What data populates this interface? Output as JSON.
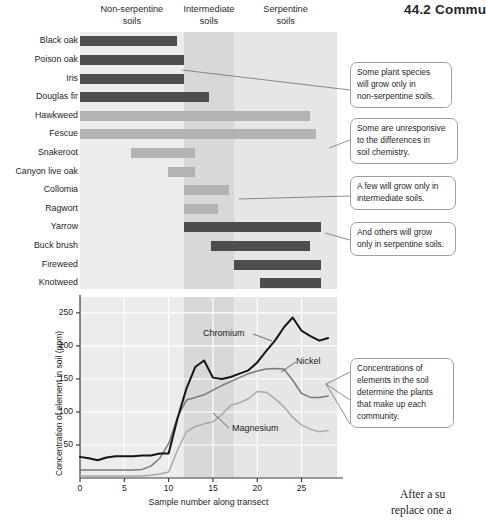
{
  "page": {
    "header": "44.2  Commu",
    "footer_line1": "After a su",
    "footer_line2": "replace one a"
  },
  "zones": [
    {
      "name": "non-serpentine",
      "line1": "Non-serpentine",
      "line2": "soils",
      "color": "#ececec"
    },
    {
      "name": "intermediate",
      "line1": "Intermediate",
      "line2": "soils",
      "color": "#d8d8d8"
    },
    {
      "name": "serpentine",
      "line1": "Serpentine",
      "line2": "soils",
      "color": "#e6e6e6"
    }
  ],
  "colors": {
    "bar_dark": "#4d4d4d",
    "bar_light": "#b3b3b3",
    "chromium": "#141414",
    "nickel": "#7a7a7a",
    "magnesium": "#a8a8a8",
    "callout_border": "#9aa0a6",
    "axis": "#3c3c3c"
  },
  "bar_chart": {
    "type": "bar",
    "orientation": "horizontal",
    "xlabel": "",
    "ylabel": "",
    "axis_min": 0,
    "axis_max": 29,
    "species": [
      {
        "label": "Black oak",
        "start": 0,
        "end": 11.0,
        "shade": "dark"
      },
      {
        "label": "Poison oak",
        "start": 0,
        "end": 11.7,
        "shade": "dark"
      },
      {
        "label": "Iris",
        "start": 0,
        "end": 11.7,
        "shade": "dark"
      },
      {
        "label": "Douglas fir",
        "start": 0,
        "end": 14.5,
        "shade": "dark"
      },
      {
        "label": "Hawkweed",
        "start": 0,
        "end": 26.0,
        "shade": "light"
      },
      {
        "label": "Fescue",
        "start": 0,
        "end": 26.6,
        "shade": "light"
      },
      {
        "label": "Snakeroot",
        "start": 5.8,
        "end": 13.0,
        "shade": "light"
      },
      {
        "label": "Canyon live oak",
        "start": 9.9,
        "end": 13.0,
        "shade": "light"
      },
      {
        "label": "Collomia",
        "start": 11.7,
        "end": 16.8,
        "shade": "light"
      },
      {
        "label": "Ragwort",
        "start": 11.7,
        "end": 15.6,
        "shade": "light"
      },
      {
        "label": "Yarrow",
        "start": 11.7,
        "end": 27.2,
        "shade": "dark"
      },
      {
        "label": "Buck brush",
        "start": 14.8,
        "end": 26.0,
        "shade": "dark"
      },
      {
        "label": "Fireweed",
        "start": 17.4,
        "end": 27.2,
        "shade": "dark"
      },
      {
        "label": "Knotweed",
        "start": 20.3,
        "end": 27.2,
        "shade": "dark"
      }
    ]
  },
  "chart_data": {
    "type": "line",
    "title": "",
    "xlabel": "Sample number along transect",
    "ylabel": "Concentration of element in soil (ppm)",
    "xlim": [
      0,
      29
    ],
    "ylim": [
      0,
      265
    ],
    "xticks": [
      0,
      5,
      10,
      15,
      20,
      25
    ],
    "yticks": [
      50,
      100,
      150,
      200,
      250
    ],
    "grid": true,
    "legend_position": "inline-annotations",
    "x": [
      0,
      1,
      2,
      3,
      4,
      5,
      6,
      7,
      8,
      9,
      10,
      11,
      12,
      13,
      14,
      15,
      16,
      17,
      18,
      19,
      20,
      21,
      22,
      23,
      24,
      25,
      26,
      27,
      28
    ],
    "series": [
      {
        "name": "Chromium",
        "color": "#141414",
        "values": [
          32,
          30,
          27,
          31,
          33,
          33,
          33,
          34,
          34,
          37,
          37,
          90,
          135,
          168,
          178,
          152,
          150,
          153,
          158,
          163,
          175,
          192,
          208,
          228,
          243,
          223,
          215,
          208,
          212
        ]
      },
      {
        "name": "Nickel",
        "color": "#7a7a7a",
        "values": [
          12,
          12,
          12,
          12,
          12,
          12,
          12,
          13,
          18,
          30,
          52,
          92,
          118,
          122,
          126,
          133,
          140,
          146,
          152,
          158,
          162,
          165,
          166,
          165,
          148,
          128,
          122,
          122,
          124
        ]
      },
      {
        "name": "Magnesium",
        "color": "#a8a8a8",
        "values": [
          3,
          3,
          3,
          3,
          3,
          3,
          3,
          3,
          4,
          6,
          9,
          42,
          70,
          78,
          82,
          85,
          96,
          110,
          114,
          120,
          131,
          130,
          120,
          108,
          92,
          80,
          74,
          70,
          72
        ]
      }
    ],
    "annotations": [
      {
        "text": "Chromium",
        "series": "Chromium"
      },
      {
        "text": "Nickel",
        "series": "Nickel"
      },
      {
        "text": "Magnesium",
        "series": "Magnesium"
      }
    ]
  },
  "callouts": [
    {
      "id": "c1",
      "lines": [
        "Some plant species",
        "will grow only in",
        "non-serpentine soils."
      ]
    },
    {
      "id": "c2",
      "lines": [
        "Some are unresponsive",
        "to the differences in",
        "soil chemistry."
      ]
    },
    {
      "id": "c3",
      "lines": [
        "A few will grow only in",
        "intermediate soils."
      ]
    },
    {
      "id": "c4",
      "lines": [
        "And others will grow",
        "only in serpentine soils."
      ]
    },
    {
      "id": "c5",
      "lines": [
        "Concentrations of",
        "elements in the soil",
        "determine the plants",
        "that make up each",
        "community."
      ]
    }
  ]
}
